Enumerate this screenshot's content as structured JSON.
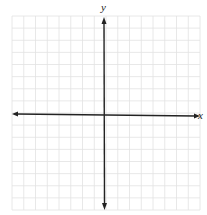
{
  "diagram": {
    "type": "coordinate-plane",
    "x_axis_label": "x",
    "y_axis_label": "y",
    "grid": {
      "columns": 16,
      "rows": 16,
      "left": 12,
      "top": 16,
      "right": 200,
      "bottom": 210,
      "line_color": "#e2e2e2",
      "axis_color": "#222222"
    },
    "origin": {
      "x": 104,
      "y": 115
    },
    "arrows": [
      "left",
      "right",
      "up",
      "down"
    ]
  }
}
